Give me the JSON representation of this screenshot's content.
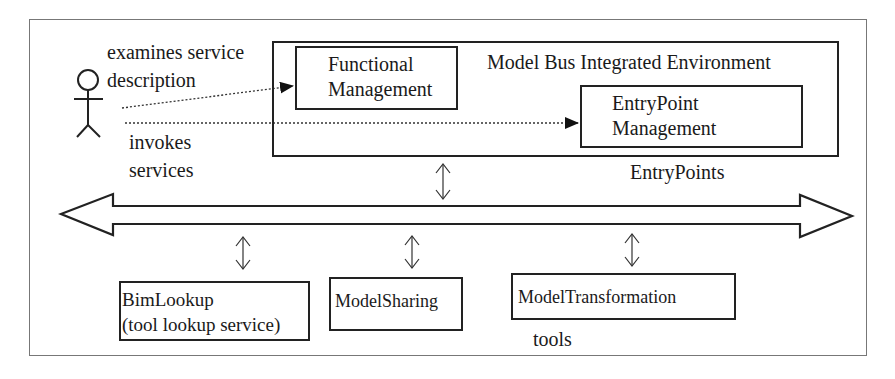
{
  "actor": {
    "label_top_line1": "examines service",
    "label_top_line2": "description",
    "label_bottom_line1": "invokes",
    "label_bottom_line2": "services"
  },
  "environment": {
    "title": "Model Bus Integrated Environment",
    "functional_management": {
      "line1": "Functional",
      "line2": "Management"
    },
    "entrypoint_management": {
      "line1": "EntryPoint",
      "line2": "Management"
    },
    "entrypoints_label": "EntryPoints"
  },
  "bus": {
    "connector_icon": "double-headed-vertical-arrow"
  },
  "tools": {
    "label": "tools",
    "items": [
      {
        "line1": "BimLookup",
        "line2": "(tool lookup service)"
      },
      {
        "line1": "ModelSharing",
        "line2": ""
      },
      {
        "line1": "ModelTransformation",
        "line2": ""
      }
    ]
  },
  "colors": {
    "stroke": "#222222",
    "frame": "#777777",
    "text": "#1a1a1a",
    "background": "#ffffff"
  }
}
